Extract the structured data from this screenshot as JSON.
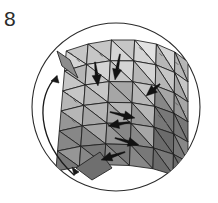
{
  "figure": {
    "label": "8",
    "kind": "line-drawing-diagram",
    "caption_visible": false,
    "background_color": "#ffffff",
    "ink_color": "#1a1a1a"
  },
  "boundary_circle": {
    "name": "outer-circle",
    "center_x": 116,
    "center_y": 107,
    "radius": 84,
    "stroke": "#2b2b2b",
    "stroke_width": 1.1,
    "fill": "none"
  },
  "rotation_arrow": {
    "name": "rotation-arc-arrow",
    "description": "counterclockwise double-headed curved arrow on left of circle",
    "stroke": "#1a1a1a",
    "stroke_width": 1.3,
    "path": "M 57 76 C 36 96 36 140 74 175",
    "head_top": "M 57 76 L 51 81 L 59 83 Z",
    "head_bottom": "M 74 175 L 72 167 L 79 172 Z"
  },
  "mesh": {
    "name": "triangulated-surface-mesh",
    "description": "curved cylindrical surface patch subdivided into shaded triangles",
    "edge_color": "#1d1d1d",
    "edge_width": 0.85,
    "rows": 7,
    "cols": 7,
    "shade_palette": [
      "#e2e2e2",
      "#d4d4d4",
      "#c6c6c6",
      "#b6b6b6",
      "#a6a6a6",
      "#969696",
      "#878787",
      "#787878",
      "#6b6b6b",
      "#ffffff"
    ],
    "grid_u": [
      [
        57,
        51
      ],
      [
        82,
        44
      ],
      [
        108,
        40
      ],
      [
        133,
        40
      ],
      [
        156,
        44
      ],
      [
        175,
        52
      ],
      [
        188,
        62
      ]
    ],
    "grid_v_offsets": [
      0,
      20,
      40,
      60,
      80,
      100,
      120
    ],
    "left_edge_bulge": -11,
    "fold_flap": {
      "name": "mesh-left-fold-flap",
      "path": "M 57 51 L 70 60 L 78 78 L 62 66 Z",
      "shade": "#8d8d8d"
    },
    "bottom_tip": {
      "name": "mesh-lower-left-tip",
      "path": "M 76 168 L 100 152 L 112 168 L 92 180 Z",
      "shade": "#6f6f6f"
    }
  },
  "vectors": {
    "name": "normal-vector-arrows",
    "description": "black tapered arrows pointing into mesh vertices",
    "color": "#121212",
    "count": 7,
    "items": [
      {
        "name": "vector-arrow-1",
        "x1": 95,
        "y1": 62,
        "x2": 98,
        "y2": 86,
        "angle": 83
      },
      {
        "name": "vector-arrow-2",
        "x1": 120,
        "y1": 54,
        "x2": 115,
        "y2": 80,
        "angle": 101
      },
      {
        "name": "vector-arrow-3",
        "x1": 160,
        "y1": 84,
        "x2": 146,
        "y2": 96,
        "angle": 140
      },
      {
        "name": "vector-arrow-4",
        "x1": 110,
        "y1": 112,
        "x2": 135,
        "y2": 118,
        "angle": 13
      },
      {
        "name": "vector-arrow-5",
        "x1": 130,
        "y1": 122,
        "x2": 108,
        "y2": 126,
        "angle": 190
      },
      {
        "name": "vector-arrow-6",
        "x1": 115,
        "y1": 138,
        "x2": 139,
        "y2": 145,
        "angle": 16
      },
      {
        "name": "vector-arrow-7",
        "x1": 125,
        "y1": 152,
        "x2": 101,
        "y2": 160,
        "angle": 198
      }
    ]
  },
  "dashed_hints": {
    "name": "hidden-edge-dashes",
    "color": "#5a5a5a",
    "dash_pattern": "4 5"
  }
}
